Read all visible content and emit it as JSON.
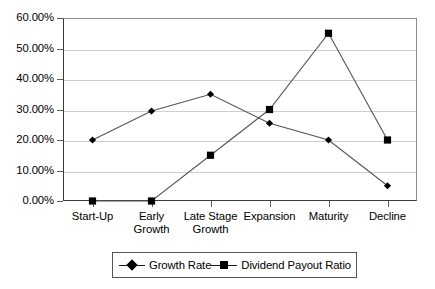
{
  "chart_data": {
    "type": "line",
    "title": "",
    "subtitle": "",
    "xlabel": "",
    "ylabel": "",
    "ylim": [
      0,
      60
    ],
    "ytick_values": [
      0,
      10,
      20,
      30,
      40,
      50,
      60
    ],
    "ytick_labels": [
      "0.00%",
      "10.00%",
      "20.00%",
      "30.00%",
      "40.00%",
      "50.00%",
      "60.00%"
    ],
    "categories": [
      "Start-Up",
      "Early Growth",
      "Late Stage Growth",
      "Expansion",
      "Maturity",
      "Decline"
    ],
    "category_lines": [
      [
        "Start-Up"
      ],
      [
        "Early",
        "Growth"
      ],
      [
        "Late Stage",
        "Growth"
      ],
      [
        "Expansion"
      ],
      [
        "Maturity"
      ],
      [
        "Decline"
      ]
    ],
    "series": [
      {
        "name": "Growth Rate",
        "marker": "diamond",
        "color": "#000000",
        "values": [
          20.0,
          29.5,
          35.0,
          25.5,
          20.0,
          5.0
        ]
      },
      {
        "name": "Dividend Payout Ratio",
        "marker": "square",
        "color": "#000000",
        "values": [
          0.0,
          0.0,
          15.0,
          30.0,
          55.0,
          20.0
        ]
      }
    ],
    "grid": true,
    "grid_axis": "y",
    "legend_position": "bottom",
    "colors": {
      "plot_background": "#ffffff",
      "gridline": "#cfcfcf",
      "axis": "#3a3a3a",
      "series_line": "#555555",
      "marker": "#000000",
      "legend_border": "#555555",
      "text": "#000000"
    }
  }
}
